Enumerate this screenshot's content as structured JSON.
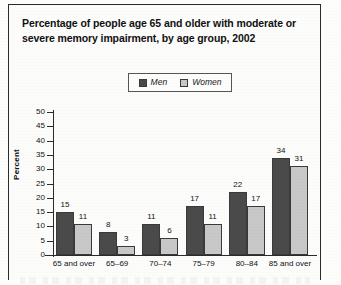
{
  "title": {
    "line1": "Percentage of people age 65 and older with moderate or",
    "line2": "severe memory impairment, by age group, 2002"
  },
  "legend": {
    "items": [
      {
        "label": "Men",
        "color": "#4a4a4a"
      },
      {
        "label": "Women",
        "color": "#c8c8c8"
      }
    ]
  },
  "axis": {
    "y_title": "Percent",
    "y_ticks": [
      "50",
      "45",
      "40",
      "35",
      "30",
      "25",
      "20",
      "15",
      "10",
      "5",
      "0"
    ]
  },
  "chart_data": {
    "type": "bar",
    "title": "Percentage of people age 65 and older with moderate or severe memory impairment, by age group, 2002",
    "xlabel": "",
    "ylabel": "Percent",
    "ylim": [
      0,
      50
    ],
    "ytick_step": 5,
    "grid": false,
    "legend_position": "top-center",
    "categories": [
      "65 and over",
      "65–69",
      "70–74",
      "75–79",
      "80–84",
      "85 and over"
    ],
    "series": [
      {
        "name": "Men",
        "color": "#4a4a4a",
        "values": [
          15,
          8,
          11,
          17,
          22,
          34
        ]
      },
      {
        "name": "Women",
        "color": "#c8c8c8",
        "values": [
          11,
          3,
          6,
          11,
          17,
          31
        ]
      }
    ]
  }
}
